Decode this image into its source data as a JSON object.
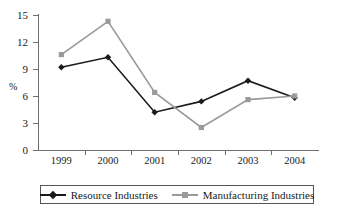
{
  "chart_data": {
    "type": "line",
    "title": "",
    "xlabel": "",
    "ylabel": "%",
    "categories": [
      "1999",
      "2000",
      "2001",
      "2002",
      "2003",
      "2004"
    ],
    "ylim": [
      0,
      15
    ],
    "yticks": [
      0,
      3,
      6,
      9,
      12,
      15
    ],
    "grid": false,
    "legend_position": "bottom",
    "series": [
      {
        "name": "Resource Industries",
        "color": "#1a1a1a",
        "marker": "diamond",
        "values": [
          9.2,
          10.3,
          4.2,
          5.4,
          7.7,
          5.8
        ]
      },
      {
        "name": "Manufacturing Industries",
        "color": "#9a9a9a",
        "marker": "square",
        "values": [
          10.6,
          14.3,
          6.4,
          2.5,
          5.6,
          6.0
        ]
      }
    ]
  },
  "axis": {
    "y_title": "%",
    "y_tick_labels": [
      "0",
      "3",
      "6",
      "9",
      "12",
      "15"
    ],
    "x_tick_labels": [
      "1999",
      "2000",
      "2001",
      "2002",
      "2003",
      "2004"
    ]
  },
  "legend": {
    "entries": [
      {
        "label": "Resource Industries"
      },
      {
        "label": "Manufacturing Industries"
      }
    ]
  },
  "colors": {
    "series_resource": "#1a1a1a",
    "series_manufacturing": "#9a9a9a",
    "axis": "#6e6e6e",
    "background": "#ffffff"
  }
}
